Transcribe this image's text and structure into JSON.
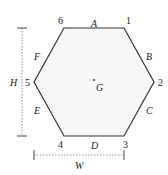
{
  "diagram": {
    "type": "hexagon-section",
    "vertices": [
      {
        "id": "1",
        "label": "1",
        "x": 124,
        "y": 28,
        "lx": 126,
        "ly": 24
      },
      {
        "id": "2",
        "label": "2",
        "x": 154,
        "y": 82,
        "lx": 158,
        "ly": 86
      },
      {
        "id": "3",
        "label": "3",
        "x": 124,
        "y": 136,
        "lx": 123,
        "ly": 148
      },
      {
        "id": "4",
        "label": "4",
        "x": 64,
        "y": 136,
        "lx": 58,
        "ly": 148
      },
      {
        "id": "5",
        "label": "5",
        "x": 34,
        "y": 82,
        "lx": 25,
        "ly": 86
      },
      {
        "id": "6",
        "label": "6",
        "x": 64,
        "y": 28,
        "lx": 58,
        "ly": 24
      }
    ],
    "sides": [
      {
        "id": "A",
        "label": "A",
        "lx": 91,
        "ly": 27
      },
      {
        "id": "B",
        "label": "B",
        "lx": 146,
        "ly": 60
      },
      {
        "id": "C",
        "label": "C",
        "lx": 146,
        "ly": 114
      },
      {
        "id": "D",
        "label": "D",
        "lx": 91,
        "ly": 149
      },
      {
        "id": "E",
        "label": "E",
        "lx": 34,
        "ly": 114
      },
      {
        "id": "F",
        "label": "F",
        "lx": 34,
        "ly": 60
      }
    ],
    "centroid": {
      "label": "G",
      "dot_x": 94,
      "dot_y": 80,
      "lx": 96,
      "ly": 91
    },
    "dimensions": {
      "height": {
        "label": "H",
        "x": 22,
        "y1": 28,
        "y2": 136,
        "lx": 10,
        "ly": 86
      },
      "width": {
        "label": "W",
        "y": 155,
        "x1": 34,
        "x2": 124,
        "lx": 75,
        "ly": 169
      }
    },
    "colors": {
      "stroke": "#333333",
      "fill": "#f7f7f7",
      "dimension": "#777777"
    }
  }
}
